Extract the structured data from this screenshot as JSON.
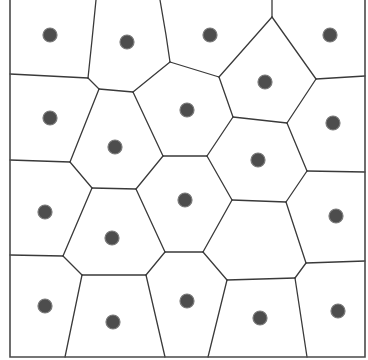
{
  "diagram": {
    "type": "voronoi",
    "colors": {
      "background": "#ffffff",
      "edge": "#3a3a3a",
      "frame": "#4a4a4a",
      "site_fill": "#4d4d4d",
      "site_stroke": "#7a7a7a"
    },
    "frame": {
      "points": [
        [
          10,
          0
        ],
        [
          10,
          357
        ],
        [
          365,
          357
        ],
        [
          365,
          0
        ]
      ]
    },
    "sites": [
      [
        50,
        35
      ],
      [
        127,
        42
      ],
      [
        210,
        35
      ],
      [
        330,
        35
      ],
      [
        50,
        118
      ],
      [
        115,
        147
      ],
      [
        187,
        110
      ],
      [
        265,
        82
      ],
      [
        333,
        123
      ],
      [
        45,
        212
      ],
      [
        112,
        238
      ],
      [
        185,
        200
      ],
      [
        258,
        160
      ],
      [
        336,
        216
      ],
      [
        45,
        306
      ],
      [
        113,
        322
      ],
      [
        187,
        301
      ],
      [
        260,
        318
      ],
      [
        338,
        311
      ]
    ],
    "edges": [
      [
        [
          96,
          0
        ],
        [
          92,
          40
        ],
        [
          88,
          78
        ]
      ],
      [
        [
          160,
          0
        ],
        [
          166,
          35
        ],
        [
          170,
          62
        ]
      ],
      [
        [
          272,
          0
        ],
        [
          272,
          17
        ]
      ],
      [
        [
          10,
          74
        ],
        [
          88,
          78
        ]
      ],
      [
        [
          88,
          78
        ],
        [
          99,
          89
        ]
      ],
      [
        [
          99,
          89
        ],
        [
          133,
          92
        ]
      ],
      [
        [
          133,
          92
        ],
        [
          170,
          62
        ]
      ],
      [
        [
          170,
          62
        ],
        [
          219,
          77
        ]
      ],
      [
        [
          219,
          77
        ],
        [
          272,
          17
        ]
      ],
      [
        [
          272,
          17
        ],
        [
          316,
          79
        ]
      ],
      [
        [
          316,
          79
        ],
        [
          365,
          76
        ]
      ],
      [
        [
          219,
          77
        ],
        [
          233,
          117
        ]
      ],
      [
        [
          316,
          79
        ],
        [
          287,
          123
        ]
      ],
      [
        [
          233,
          117
        ],
        [
          287,
          123
        ]
      ],
      [
        [
          287,
          123
        ],
        [
          307,
          171
        ]
      ],
      [
        [
          307,
          171
        ],
        [
          365,
          172
        ]
      ],
      [
        [
          307,
          171
        ],
        [
          286,
          202
        ]
      ],
      [
        [
          99,
          89
        ],
        [
          70,
          162
        ]
      ],
      [
        [
          133,
          92
        ],
        [
          163,
          156
        ]
      ],
      [
        [
          10,
          160
        ],
        [
          70,
          162
        ]
      ],
      [
        [
          163,
          156
        ],
        [
          207,
          156
        ]
      ],
      [
        [
          207,
          156
        ],
        [
          233,
          117
        ]
      ],
      [
        [
          207,
          156
        ],
        [
          232,
          200
        ]
      ],
      [
        [
          232,
          200
        ],
        [
          286,
          202
        ]
      ],
      [
        [
          70,
          162
        ],
        [
          92,
          188
        ]
      ],
      [
        [
          92,
          188
        ],
        [
          136,
          189
        ]
      ],
      [
        [
          136,
          189
        ],
        [
          163,
          156
        ]
      ],
      [
        [
          92,
          188
        ],
        [
          63,
          256
        ]
      ],
      [
        [
          136,
          189
        ],
        [
          165,
          252
        ]
      ],
      [
        [
          232,
          200
        ],
        [
          203,
          252
        ]
      ],
      [
        [
          10,
          255
        ],
        [
          63,
          256
        ]
      ],
      [
        [
          165,
          252
        ],
        [
          203,
          252
        ]
      ],
      [
        [
          63,
          256
        ],
        [
          82,
          275
        ]
      ],
      [
        [
          165,
          252
        ],
        [
          146,
          275
        ]
      ],
      [
        [
          82,
          275
        ],
        [
          146,
          275
        ]
      ],
      [
        [
          82,
          275
        ],
        [
          65,
          357
        ]
      ],
      [
        [
          146,
          275
        ],
        [
          165,
          357
        ]
      ],
      [
        [
          203,
          252
        ],
        [
          227,
          280
        ]
      ],
      [
        [
          286,
          202
        ],
        [
          306,
          263
        ]
      ],
      [
        [
          306,
          263
        ],
        [
          365,
          261
        ]
      ],
      [
        [
          306,
          263
        ],
        [
          295,
          278
        ]
      ],
      [
        [
          227,
          280
        ],
        [
          295,
          278
        ]
      ],
      [
        [
          227,
          280
        ],
        [
          208,
          357
        ]
      ],
      [
        [
          295,
          278
        ],
        [
          307,
          357
        ]
      ]
    ]
  }
}
